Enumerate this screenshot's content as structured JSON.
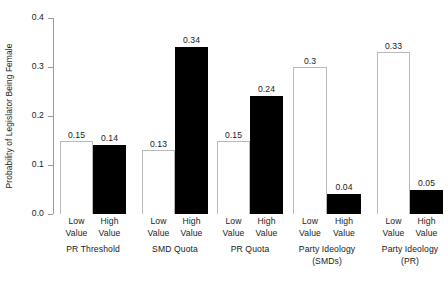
{
  "chart_data": {
    "type": "bar",
    "title": "",
    "xlabel": "",
    "ylabel": "Probability of Legislator Being Female",
    "ylim": [
      0.0,
      0.4
    ],
    "ytick_labels": [
      "0.0",
      "0.1",
      "0.2",
      "0.3",
      "0.4"
    ],
    "ytick_values": [
      0.0,
      0.1,
      0.2,
      0.3,
      0.4
    ],
    "grid": false,
    "legend": "none",
    "subcategories": [
      "Low Value",
      "High Value"
    ],
    "categories": [
      "PR Threshold",
      "SMD Quota",
      "PR Quota",
      "Party Ideology (SMDs)",
      "Party Ideology (PR)"
    ],
    "series": [
      {
        "name": "Low Value",
        "color": "#ffffff",
        "values": [
          0.15,
          0.13,
          0.15,
          0.3,
          0.33
        ],
        "labels": [
          "0.15",
          "0.13",
          "0.15",
          "0.3",
          "0.33"
        ]
      },
      {
        "name": "High Value",
        "color": "#000000",
        "values": [
          0.14,
          0.34,
          0.24,
          0.04,
          0.05
        ],
        "labels": [
          "0.14",
          "0.34",
          "0.24",
          "0.04",
          "0.05"
        ]
      }
    ],
    "groups": [
      {
        "name": "PR Threshold",
        "name_lines": [
          "PR Threshold"
        ],
        "bars": [
          {
            "tick_lines": [
              "Low",
              "Value"
            ],
            "value": 0.15,
            "label": "0.15",
            "fill": "white"
          },
          {
            "tick_lines": [
              "High",
              "Value"
            ],
            "value": 0.14,
            "label": "0.14",
            "fill": "black"
          }
        ]
      },
      {
        "name": "SMD Quota",
        "name_lines": [
          "SMD Quota"
        ],
        "bars": [
          {
            "tick_lines": [
              "Low",
              "Value"
            ],
            "value": 0.13,
            "label": "0.13",
            "fill": "white"
          },
          {
            "tick_lines": [
              "High",
              "Value"
            ],
            "value": 0.34,
            "label": "0.34",
            "fill": "black"
          }
        ]
      },
      {
        "name": "PR Quota",
        "name_lines": [
          "PR Quota"
        ],
        "bars": [
          {
            "tick_lines": [
              "Low",
              "Value"
            ],
            "value": 0.15,
            "label": "0.15",
            "fill": "white"
          },
          {
            "tick_lines": [
              "High",
              "Value"
            ],
            "value": 0.24,
            "label": "0.24",
            "fill": "black"
          }
        ]
      },
      {
        "name": "Party Ideology (SMDs)",
        "name_lines": [
          "Party Ideology",
          "(SMDs)"
        ],
        "bars": [
          {
            "tick_lines": [
              "Low",
              "Value"
            ],
            "value": 0.3,
            "label": "0.3",
            "fill": "white"
          },
          {
            "tick_lines": [
              "High",
              "Value"
            ],
            "value": 0.04,
            "label": "0.04",
            "fill": "black"
          }
        ]
      },
      {
        "name": "Party Ideology (PR)",
        "name_lines": [
          "Party Ideology",
          "(PR)"
        ],
        "bars": [
          {
            "tick_lines": [
              "Low",
              "Value"
            ],
            "value": 0.33,
            "label": "0.33",
            "fill": "white"
          },
          {
            "tick_lines": [
              "High",
              "Value"
            ],
            "value": 0.05,
            "label": "0.05",
            "fill": "black"
          }
        ]
      }
    ],
    "colors": {
      "axis": "#9a9a9a",
      "bar_white_fill": "#ffffff",
      "bar_white_stroke": "#b9b9b9",
      "bar_black_fill": "#000000",
      "text": "#1a1a1a",
      "background": "#ffffff"
    }
  }
}
